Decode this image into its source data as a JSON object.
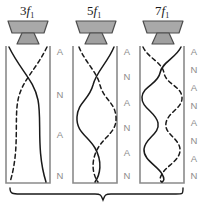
{
  "figure": {
    "background_color": "#ffffff",
    "wave_color": "#1a1a1a",
    "tube_color": "#8a8a8a",
    "label_color": "#8c8c8c",
    "speaker_fill": "#a9a9a9",
    "speaker_stroke": "#4d4d4d"
  },
  "tubes": [
    {
      "id": "tube-3f1",
      "label_coefficient": "3",
      "label_symbol": "f",
      "label_subscript": "1",
      "label_text": "3f1",
      "harmonic_number": 3,
      "speaker_icon": "speaker-icon",
      "marks": [
        {
          "text": "A",
          "kind": "antinode",
          "y": 52
        },
        {
          "text": "N",
          "kind": "node",
          "y": 95
        },
        {
          "text": "A",
          "kind": "antinode",
          "y": 135
        },
        {
          "text": "N",
          "kind": "node",
          "y": 176
        }
      ]
    },
    {
      "id": "tube-5f1",
      "label_coefficient": "5",
      "label_symbol": "f",
      "label_subscript": "1",
      "label_text": "5f1",
      "harmonic_number": 5,
      "speaker_icon": "speaker-icon",
      "marks": [
        {
          "text": "A",
          "kind": "antinode",
          "y": 52
        },
        {
          "text": "N",
          "kind": "node",
          "y": 77
        },
        {
          "text": "A",
          "kind": "antinode",
          "y": 103
        },
        {
          "text": "N",
          "kind": "node",
          "y": 128
        },
        {
          "text": "A",
          "kind": "antinode",
          "y": 153
        },
        {
          "text": "N",
          "kind": "node",
          "y": 176
        }
      ]
    },
    {
      "id": "tube-7f1",
      "label_coefficient": "7",
      "label_symbol": "f",
      "label_subscript": "1",
      "label_text": "7f1",
      "harmonic_number": 7,
      "speaker_icon": "speaker-icon",
      "marks": [
        {
          "text": "A",
          "kind": "antinode",
          "y": 52
        },
        {
          "text": "N",
          "kind": "node",
          "y": 70
        },
        {
          "text": "A",
          "kind": "antinode",
          "y": 88
        },
        {
          "text": "N",
          "kind": "node",
          "y": 106
        },
        {
          "text": "A",
          "kind": "antinode",
          "y": 123
        },
        {
          "text": "N",
          "kind": "node",
          "y": 141
        },
        {
          "text": "A",
          "kind": "antinode",
          "y": 159
        },
        {
          "text": "N",
          "kind": "node",
          "y": 176
        }
      ]
    }
  ],
  "brace": {
    "name": "bottom-brace",
    "label": ""
  }
}
